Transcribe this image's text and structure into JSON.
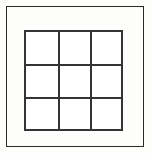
{
  "figure": {
    "canvas": {
      "width_px": 151,
      "height_px": 153,
      "background_color": "#fdfdfc"
    },
    "outer_frame": {
      "name": "outer border",
      "x_px": 6,
      "y_px": 6,
      "width_px": 138,
      "height_px": 141,
      "stroke_color": "#2a2a2a",
      "stroke_width_px": 1.5,
      "fill": "none"
    },
    "grid": {
      "name": "3x3 grid",
      "rows": 3,
      "columns": 3,
      "cell_count": 9,
      "x_px": 24,
      "y_px": 30,
      "width_px": 99,
      "height_px": 101,
      "stroke_color": "#343434",
      "stroke_width_px": 2,
      "cell_fill": "#ffffff",
      "vertical_divider_x_px": [
        58,
        90
      ],
      "horizontal_divider_y_px": [
        64,
        97
      ],
      "cells": [
        {
          "id": "r1c1",
          "row": 1,
          "column": 1,
          "label": ""
        },
        {
          "id": "r1c2",
          "row": 1,
          "column": 2,
          "label": ""
        },
        {
          "id": "r1c3",
          "row": 1,
          "column": 3,
          "label": ""
        },
        {
          "id": "r2c1",
          "row": 2,
          "column": 1,
          "label": ""
        },
        {
          "id": "r2c2",
          "row": 2,
          "column": 2,
          "label": ""
        },
        {
          "id": "r2c3",
          "row": 2,
          "column": 3,
          "label": ""
        },
        {
          "id": "r3c1",
          "row": 3,
          "column": 1,
          "label": ""
        },
        {
          "id": "r3c2",
          "row": 3,
          "column": 2,
          "label": ""
        },
        {
          "id": "r3c3",
          "row": 3,
          "column": 3,
          "label": ""
        }
      ]
    }
  }
}
